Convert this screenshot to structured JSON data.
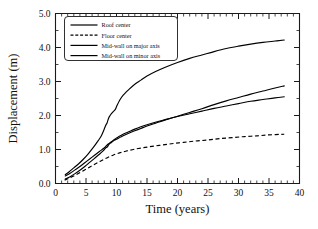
{
  "chart_data": {
    "type": "line",
    "title": "",
    "xlabel": "Time (years)",
    "ylabel": "Displacement (m)",
    "xlim": [
      0,
      40
    ],
    "ylim": [
      0,
      5.0
    ],
    "xticks": [
      0,
      5,
      10,
      15,
      20,
      25,
      30,
      35,
      40
    ],
    "xticklabels": [
      "0",
      "5",
      "10",
      "15",
      "20",
      "25",
      "30",
      "35",
      "40"
    ],
    "yticks": [
      0.0,
      1.0,
      2.0,
      3.0,
      4.0,
      5.0
    ],
    "yticklabels": [
      "0.0",
      "1.0",
      "2.0",
      "3.0",
      "4.0",
      "5.0"
    ],
    "x_minor_step": 1,
    "y_minor_step": 0.5,
    "grid": false,
    "legend_position": "upper-left",
    "series": [
      {
        "name": "Roof center",
        "style": "solid",
        "color": "#000000",
        "points": [
          [
            1.6,
            0.26
          ],
          [
            2.2,
            0.34
          ],
          [
            3.0,
            0.46
          ],
          [
            3.8,
            0.58
          ],
          [
            4.6,
            0.72
          ],
          [
            5.4,
            0.88
          ],
          [
            6.2,
            1.06
          ],
          [
            7.0,
            1.26
          ],
          [
            7.5,
            1.4
          ],
          [
            7.9,
            1.56
          ],
          [
            8.2,
            1.7
          ],
          [
            8.45,
            1.78
          ],
          [
            8.7,
            1.92
          ],
          [
            8.95,
            2.0
          ],
          [
            9.2,
            2.06
          ],
          [
            9.5,
            2.12
          ],
          [
            9.8,
            2.18
          ],
          [
            10.1,
            2.3
          ],
          [
            10.5,
            2.44
          ],
          [
            11.0,
            2.58
          ],
          [
            12.0,
            2.76
          ],
          [
            13.0,
            2.92
          ],
          [
            14.0,
            3.04
          ],
          [
            15.0,
            3.16
          ],
          [
            16.5,
            3.3
          ],
          [
            18.0,
            3.42
          ],
          [
            20.0,
            3.56
          ],
          [
            22.0,
            3.68
          ],
          [
            24.0,
            3.78
          ],
          [
            26.0,
            3.88
          ],
          [
            28.0,
            3.97
          ],
          [
            30.0,
            4.04
          ],
          [
            32.0,
            4.1
          ],
          [
            34.0,
            4.15
          ],
          [
            36.0,
            4.19
          ],
          [
            37.5,
            4.22
          ]
        ]
      },
      {
        "name": "Floor center",
        "style": "dashed",
        "color": "#000000",
        "points": [
          [
            1.5,
            0.1
          ],
          [
            2.5,
            0.18
          ],
          [
            3.5,
            0.27
          ],
          [
            4.5,
            0.37
          ],
          [
            5.5,
            0.47
          ],
          [
            6.5,
            0.57
          ],
          [
            7.5,
            0.67
          ],
          [
            8.5,
            0.76
          ],
          [
            9.5,
            0.84
          ],
          [
            10.5,
            0.9
          ],
          [
            11.5,
            0.95
          ],
          [
            13.0,
            1.01
          ],
          [
            15.0,
            1.07
          ],
          [
            17.0,
            1.12
          ],
          [
            19.0,
            1.17
          ],
          [
            21.0,
            1.21
          ],
          [
            23.0,
            1.25
          ],
          [
            25.0,
            1.28
          ],
          [
            27.0,
            1.32
          ],
          [
            29.0,
            1.35
          ],
          [
            31.0,
            1.38
          ],
          [
            33.0,
            1.4
          ],
          [
            35.0,
            1.43
          ],
          [
            37.5,
            1.45
          ]
        ]
      },
      {
        "name": "Mid-wall on major axis",
        "style": "solid",
        "color": "#000000",
        "points": [
          [
            1.6,
            0.13
          ],
          [
            2.4,
            0.2
          ],
          [
            3.2,
            0.29
          ],
          [
            4.0,
            0.39
          ],
          [
            4.8,
            0.5
          ],
          [
            5.6,
            0.62
          ],
          [
            6.4,
            0.74
          ],
          [
            7.2,
            0.86
          ],
          [
            7.8,
            0.96
          ],
          [
            8.2,
            1.04
          ],
          [
            8.5,
            1.08
          ],
          [
            8.8,
            1.16
          ],
          [
            9.1,
            1.2
          ],
          [
            9.4,
            1.24
          ],
          [
            9.7,
            1.28
          ],
          [
            10.0,
            1.3
          ],
          [
            10.4,
            1.34
          ],
          [
            11.0,
            1.4
          ],
          [
            12.0,
            1.48
          ],
          [
            13.0,
            1.55
          ],
          [
            14.0,
            1.62
          ],
          [
            15.0,
            1.69
          ],
          [
            16.5,
            1.78
          ],
          [
            18.0,
            1.87
          ],
          [
            20.0,
            1.98
          ],
          [
            22.0,
            2.09
          ],
          [
            24.0,
            2.2
          ],
          [
            26.0,
            2.32
          ],
          [
            28.0,
            2.43
          ],
          [
            30.0,
            2.53
          ],
          [
            32.0,
            2.63
          ],
          [
            34.0,
            2.72
          ],
          [
            36.0,
            2.81
          ],
          [
            37.5,
            2.87
          ]
        ]
      },
      {
        "name": "Mid-wall on minor axis",
        "style": "solid",
        "color": "#000000",
        "points": [
          [
            1.6,
            0.22
          ],
          [
            2.4,
            0.3
          ],
          [
            3.2,
            0.4
          ],
          [
            4.0,
            0.5
          ],
          [
            4.8,
            0.61
          ],
          [
            5.6,
            0.72
          ],
          [
            6.4,
            0.83
          ],
          [
            7.2,
            0.94
          ],
          [
            7.8,
            1.02
          ],
          [
            8.2,
            1.08
          ],
          [
            8.5,
            1.14
          ],
          [
            8.8,
            1.18
          ],
          [
            9.1,
            1.22
          ],
          [
            9.4,
            1.26
          ],
          [
            9.7,
            1.3
          ],
          [
            10.0,
            1.34
          ],
          [
            10.4,
            1.38
          ],
          [
            11.0,
            1.44
          ],
          [
            12.0,
            1.52
          ],
          [
            13.0,
            1.6
          ],
          [
            14.0,
            1.67
          ],
          [
            15.0,
            1.73
          ],
          [
            16.5,
            1.81
          ],
          [
            18.0,
            1.88
          ],
          [
            20.0,
            1.97
          ],
          [
            22.0,
            2.05
          ],
          [
            24.0,
            2.13
          ],
          [
            26.0,
            2.21
          ],
          [
            28.0,
            2.28
          ],
          [
            30.0,
            2.35
          ],
          [
            32.0,
            2.42
          ],
          [
            34.0,
            2.47
          ],
          [
            36.0,
            2.52
          ],
          [
            37.5,
            2.55
          ]
        ]
      }
    ]
  },
  "legend": {
    "items": [
      {
        "label": "Roof center"
      },
      {
        "label": "Floor center"
      },
      {
        "label": "Mid-wall on major axis"
      },
      {
        "label": "Mid-wall on minor axis"
      }
    ]
  }
}
